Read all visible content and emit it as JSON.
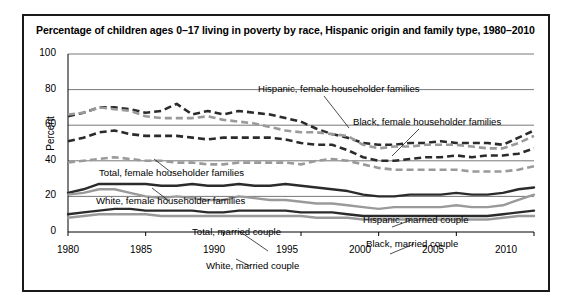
{
  "chart_data": {
    "type": "line",
    "title": "Percentage of children ages 0–17 living in poverty by race, Hispanic origin and family type, 1980–2010",
    "xlabel": "",
    "ylabel": "Percent",
    "ylim": [
      0,
      100
    ],
    "xlim": [
      1980,
      2010
    ],
    "yticks": [
      "0",
      "20",
      "40",
      "60",
      "80",
      "100"
    ],
    "xticks": [
      "1980",
      "1985",
      "1990",
      "1995",
      "2000",
      "2005",
      "2010"
    ],
    "grid": true,
    "legend_position": "inline-annotations",
    "x": [
      1980,
      1981,
      1982,
      1983,
      1984,
      1985,
      1986,
      1987,
      1988,
      1989,
      1990,
      1991,
      1992,
      1993,
      1994,
      1995,
      1996,
      1997,
      1998,
      1999,
      2000,
      2001,
      2002,
      2003,
      2004,
      2005,
      2006,
      2007,
      2008,
      2009,
      2010
    ],
    "series": [
      {
        "name": "Black, female householder families",
        "style": "dashed",
        "color": "#2b2b2b",
        "values": [
          65,
          67,
          70,
          70,
          69,
          67,
          68,
          72,
          66,
          68,
          66,
          68,
          67,
          66,
          64,
          62,
          58,
          55,
          53,
          50,
          49,
          49,
          50,
          50,
          51,
          50,
          50,
          50,
          49,
          53,
          57
        ]
      },
      {
        "name": "Hispanic, female householder families",
        "style": "dashed",
        "color": "#9a9a9a",
        "values": [
          66,
          67,
          70,
          69,
          68,
          65,
          64,
          64,
          64,
          65,
          63,
          62,
          61,
          59,
          57,
          56,
          56,
          55,
          54,
          49,
          47,
          48,
          48,
          49,
          49,
          49,
          48,
          47,
          47,
          50,
          54
        ]
      },
      {
        "name": "Total, female householder families",
        "style": "dashed",
        "color": "#2b2b2b",
        "values": [
          51,
          53,
          56,
          57,
          55,
          54,
          54,
          54,
          53,
          52,
          53,
          53,
          53,
          53,
          52,
          50,
          49,
          49,
          46,
          42,
          40,
          40,
          41,
          42,
          42,
          43,
          42,
          43,
          43,
          44,
          47
        ]
      },
      {
        "name": "White, female householder families",
        "style": "dashed",
        "color": "#9a9a9a",
        "values": [
          39,
          40,
          41,
          42,
          41,
          40,
          40,
          39,
          39,
          38,
          38,
          39,
          39,
          39,
          39,
          38,
          40,
          41,
          40,
          38,
          36,
          35,
          35,
          35,
          35,
          35,
          34,
          34,
          34,
          35,
          37
        ]
      },
      {
        "name": "Hispanic, married couple",
        "style": "solid",
        "color": "#2b2b2b",
        "values": [
          22,
          24,
          27,
          27,
          27,
          27,
          26,
          26,
          27,
          26,
          26,
          27,
          26,
          26,
          27,
          26,
          25,
          24,
          23,
          21,
          20,
          20,
          21,
          21,
          21,
          22,
          21,
          21,
          22,
          24,
          25
        ]
      },
      {
        "name": "Black, married couple",
        "style": "solid",
        "color": "#9a9a9a",
        "values": [
          21,
          22,
          24,
          24,
          22,
          20,
          19,
          20,
          19,
          18,
          18,
          20,
          19,
          18,
          18,
          17,
          16,
          16,
          15,
          14,
          13,
          14,
          14,
          14,
          14,
          15,
          14,
          14,
          15,
          18,
          21
        ]
      },
      {
        "name": "Total, married couple",
        "style": "solid",
        "color": "#2b2b2b",
        "values": [
          10,
          11,
          12,
          13,
          13,
          12,
          12,
          12,
          12,
          11,
          11,
          12,
          12,
          12,
          12,
          11,
          11,
          11,
          10,
          9,
          9,
          9,
          9,
          9,
          9,
          9,
          9,
          9,
          10,
          11,
          12
        ]
      },
      {
        "name": "White, married couple",
        "style": "solid",
        "color": "#9a9a9a",
        "values": [
          8,
          9,
          10,
          10,
          10,
          10,
          9,
          9,
          9,
          9,
          9,
          9,
          9,
          9,
          9,
          9,
          8,
          8,
          8,
          7,
          7,
          7,
          7,
          7,
          7,
          7,
          7,
          7,
          8,
          9,
          9
        ]
      }
    ],
    "annotations": [
      {
        "text": "Hispanic, female householder families",
        "x": 234,
        "y": 74
      },
      {
        "text": "Black, female householder families",
        "x": 329,
        "y": 107
      },
      {
        "text": "Total, female householder families",
        "x": 75,
        "y": 158
      },
      {
        "text": "White, female householder families",
        "x": 72,
        "y": 186
      },
      {
        "text": "Hispanic, married couple",
        "x": 337,
        "y": 205
      },
      {
        "text": "Total, married couple",
        "x": 168,
        "y": 217
      },
      {
        "text": "Black, married couple",
        "x": 340,
        "y": 229
      },
      {
        "text": "White, married couple",
        "x": 180,
        "y": 251
      }
    ]
  },
  "colors": {
    "dark": "#2b2b2b",
    "gray": "#9a9a9a",
    "axis": "#000000",
    "grid": "#555555",
    "border": "#1a1a1a",
    "background": "#ffffff"
  }
}
